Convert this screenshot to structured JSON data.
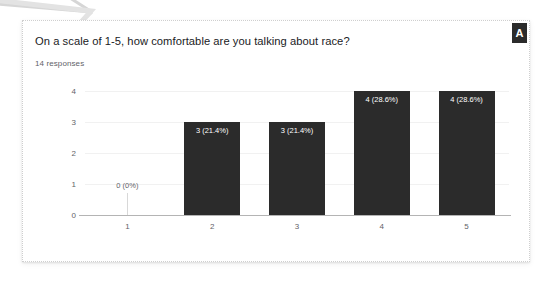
{
  "card": {
    "badge_label": "A"
  },
  "header": {
    "question": "On a scale of 1-5, how comfortable are you talking about race?",
    "responses": "14 responses"
  },
  "colors": {
    "bar": "#2b2b2b",
    "badge_background": "#2b2b2b",
    "axis": "#b4b4b4",
    "gridline": "#f1f1f1",
    "tick_text": "#5f6368",
    "title_text": "#202124",
    "card_border": "#cfcfcf",
    "page_background": "#ffffff"
  },
  "chart_data": {
    "type": "bar",
    "title": "On a scale of 1-5, how comfortable are you talking about race?",
    "subtitle": "14 responses",
    "xlabel": "",
    "ylabel": "",
    "categories": [
      "1",
      "2",
      "3",
      "4",
      "5"
    ],
    "values": [
      0,
      3,
      3,
      4,
      4
    ],
    "data_labels": [
      "0 (0%)",
      "3 (21.4%)",
      "3 (21.4%)",
      "4 (28.6%)",
      "4 (28.6%)"
    ],
    "percentages": [
      0,
      21.4,
      21.4,
      28.6,
      28.6
    ],
    "total_responses": 14,
    "ylim": [
      0,
      4
    ],
    "yticks": [
      "0",
      "1",
      "2",
      "3",
      "4"
    ],
    "xticks": [
      "1",
      "2",
      "3",
      "4",
      "5"
    ],
    "grid": true,
    "legend": "none",
    "bar_color": "#2b2b2b"
  }
}
